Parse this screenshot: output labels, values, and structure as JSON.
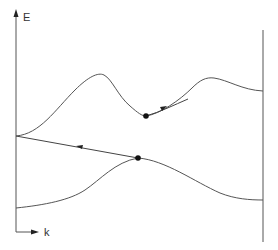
{
  "diagram": {
    "type": "band-structure",
    "axes": {
      "y_label": "E",
      "x_label": "k"
    },
    "bands": [
      {
        "name": "upper-band",
        "description": "conduction band with two maxima and a central minimum"
      },
      {
        "name": "lower-band",
        "description": "valence band with a maximum"
      }
    ],
    "points": [
      {
        "name": "upper-band-minimum-electron",
        "band": "upper-band"
      },
      {
        "name": "lower-band-maximum-hole",
        "band": "lower-band"
      }
    ],
    "transitions": [
      {
        "name": "intraband-scattering-arrow",
        "from": "upper-band-minimum-electron",
        "direction": "up-right along band"
      },
      {
        "name": "interband-transition-arrow",
        "from": "lower-band-maximum-hole",
        "direction": "left toward k=0"
      }
    ],
    "colors": {
      "line": "#555555",
      "dot": "#111111",
      "background": "#ffffff"
    }
  }
}
